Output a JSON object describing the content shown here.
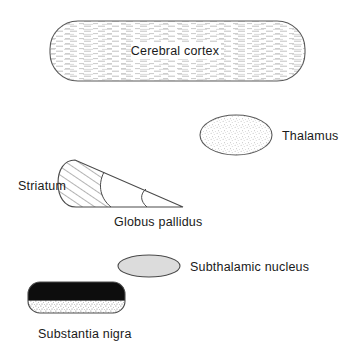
{
  "figure": {
    "background_color": "#ffffff",
    "outline_color": "#4a4a4a",
    "text_color": "#1a1a1a"
  },
  "structures": {
    "cerebral_cortex": {
      "label": "Cerebral cortex",
      "shape": "rounded-rectangle",
      "fill_texture": "horizontal-dashed-lines",
      "fill_color": "#ffffff",
      "x": 50,
      "y": 21,
      "width": 255,
      "height": 60,
      "radius": 28,
      "label_x": 175,
      "label_y": 55
    },
    "thalamus": {
      "label": "Thalamus",
      "shape": "ellipse",
      "fill_texture": "stipple",
      "fill_color": "#fdfdfd",
      "cx": 236,
      "cy": 135,
      "rx": 36,
      "ry": 20,
      "label_x": 282,
      "label_y": 140
    },
    "striatum": {
      "label": "Striatum",
      "shape": "wedge-segment-hatched",
      "fill_texture": "diagonal-hatch",
      "fill_color": "#ffffff",
      "label_x": 18,
      "label_y": 190
    },
    "globus_pallidus": {
      "label": "Globus pallidus",
      "shape": "wedge-segment-plain",
      "fill_texture": "none",
      "fill_color": "#ffffff",
      "label_x": 114,
      "label_y": 226
    },
    "subthalamic_nucleus": {
      "label": "Subthalamic nucleus",
      "shape": "flat-ellipse",
      "fill_texture": "solid-gray",
      "fill_color": "#d9d9d9",
      "cx": 149,
      "cy": 266,
      "rx": 31,
      "ry": 11,
      "label_x": 190,
      "label_y": 271
    },
    "substantia_nigra": {
      "label": "Substantia nigra",
      "shape": "rounded-rectangle-split",
      "fill_texture_top": "solid-black",
      "fill_texture_bottom": "stipple",
      "fill_color_top": "#0d0d0d",
      "fill_color_bottom": "#ffffff",
      "x": 28,
      "y": 282,
      "width": 97,
      "height": 31,
      "radius": 12,
      "split_ratio": 0.6,
      "label_x": 38,
      "label_y": 338
    }
  }
}
